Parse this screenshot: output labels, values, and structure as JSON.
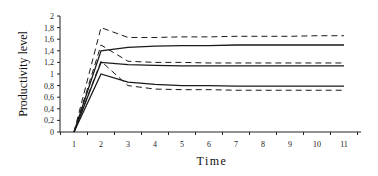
{
  "chart_data": {
    "type": "line",
    "title": "",
    "xlabel": "Time",
    "ylabel": "Productivity level",
    "x": [
      1,
      2,
      3,
      4,
      5,
      6,
      7,
      8,
      9,
      10,
      11
    ],
    "xticks": [
      "1",
      "2",
      "3",
      "4",
      "5",
      "6",
      "7",
      "8",
      "9",
      "10",
      "11"
    ],
    "yticks": [
      "0",
      "0,2",
      "0,4",
      "0,6",
      "0,8",
      "1",
      "1,2",
      "1,4",
      "1,6",
      "1,8",
      "2"
    ],
    "ylim": [
      0,
      2
    ],
    "xlim": [
      0.5,
      11.6
    ],
    "grid": false,
    "legend": null,
    "series": [
      {
        "name": "upper-dashed",
        "style": "dashed",
        "values": [
          0,
          1.8,
          1.63,
          1.63,
          1.64,
          1.64,
          1.65,
          1.65,
          1.65,
          1.66,
          1.66
        ]
      },
      {
        "name": "upper-solid",
        "style": "solid",
        "values": [
          0,
          1.4,
          1.46,
          1.48,
          1.49,
          1.49,
          1.5,
          1.5,
          1.5,
          1.5,
          1.5
        ]
      },
      {
        "name": "middle-dashed",
        "style": "dashed",
        "values": [
          0,
          1.5,
          1.22,
          1.2,
          1.2,
          1.19,
          1.19,
          1.19,
          1.19,
          1.19,
          1.19
        ]
      },
      {
        "name": "middle-solid",
        "style": "solid",
        "values": [
          0,
          1.2,
          1.16,
          1.15,
          1.14,
          1.14,
          1.14,
          1.14,
          1.14,
          1.14,
          1.14
        ]
      },
      {
        "name": "lower-solid",
        "style": "solid",
        "values": [
          0,
          1.0,
          0.86,
          0.82,
          0.8,
          0.8,
          0.79,
          0.79,
          0.79,
          0.79,
          0.79
        ]
      },
      {
        "name": "lower-dashed",
        "style": "dashed",
        "values": [
          0,
          1.22,
          0.8,
          0.74,
          0.73,
          0.73,
          0.72,
          0.72,
          0.72,
          0.72,
          0.72
        ]
      }
    ]
  },
  "axes": {
    "x_title": "Time",
    "y_title": "Productivity level"
  }
}
